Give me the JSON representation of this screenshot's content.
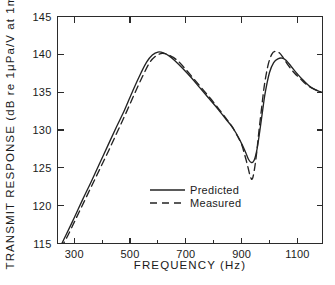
{
  "chart_data": {
    "type": "line",
    "title": "",
    "xlabel": "FREQUENCY  (Hz)",
    "ylabel": "TRANSMIT RESPONSE (dB re 1μPa/V at 1m)",
    "xlim": [
      240,
      1190
    ],
    "ylim": [
      115,
      145
    ],
    "xticks": [
      300,
      500,
      700,
      900,
      1100
    ],
    "xtick_labels": [
      "300",
      "500",
      "700",
      "900",
      "1100"
    ],
    "xminor_ticks": [
      400,
      600,
      800,
      1000
    ],
    "yticks": [
      115,
      120,
      125,
      130,
      135,
      140,
      145
    ],
    "ytick_labels": [
      "115",
      "120",
      "125",
      "130",
      "135",
      "140",
      "145"
    ],
    "grid": false,
    "legend_position": "center-bottom",
    "series": [
      {
        "name": "Predicted",
        "style": "solid",
        "color": "#232323",
        "x": [
          248,
          270,
          300,
          330,
          360,
          390,
          420,
          450,
          480,
          510,
          540,
          560,
          580,
          600,
          620,
          640,
          660,
          690,
          720,
          750,
          780,
          810,
          840,
          860,
          880,
          900,
          915,
          925,
          935,
          945,
          955,
          965,
          975,
          985,
          1000,
          1015,
          1030,
          1045,
          1060,
          1080,
          1100,
          1120,
          1150,
          1185
        ],
        "y": [
          114.4,
          116.1,
          118.4,
          120.8,
          123.1,
          125.5,
          127.9,
          130.3,
          132.6,
          135.2,
          137.6,
          139.0,
          139.9,
          140.3,
          140.2,
          139.8,
          139.2,
          138.1,
          136.9,
          135.6,
          134.3,
          133.0,
          131.6,
          130.7,
          129.6,
          128.2,
          127.0,
          126.1,
          125.7,
          126.0,
          127.4,
          129.8,
          132.5,
          135.0,
          137.6,
          138.9,
          139.4,
          139.5,
          139.2,
          138.3,
          137.4,
          136.6,
          135.6,
          135.0
        ]
      },
      {
        "name": "Measured",
        "style": "dashed",
        "color": "#232323",
        "x": [
          252,
          275,
          305,
          335,
          365,
          395,
          425,
          455,
          485,
          515,
          545,
          570,
          590,
          610,
          625,
          640,
          655,
          675,
          700,
          730,
          760,
          790,
          820,
          845,
          865,
          885,
          900,
          912,
          922,
          930,
          938,
          946,
          954,
          962,
          972,
          982,
          995,
          1008,
          1020,
          1035,
          1050,
          1070,
          1090,
          1110,
          1140,
          1185
        ],
        "y": [
          114.4,
          115.9,
          118.2,
          120.5,
          122.8,
          125.1,
          127.4,
          129.8,
          132.2,
          134.7,
          137.1,
          138.9,
          139.7,
          140.1,
          140.1,
          139.9,
          139.6,
          139.0,
          138.0,
          136.7,
          135.4,
          134.1,
          132.7,
          131.5,
          130.5,
          129.2,
          128.1,
          126.6,
          125.2,
          124.0,
          123.5,
          124.8,
          127.0,
          129.8,
          133.0,
          136.0,
          138.6,
          140.0,
          140.4,
          140.2,
          139.5,
          138.4,
          137.5,
          136.8,
          135.8,
          135.0
        ]
      }
    ],
    "legend": [
      {
        "label": "Predicted",
        "style": "solid"
      },
      {
        "label": "Measured",
        "style": "dashed"
      }
    ]
  }
}
